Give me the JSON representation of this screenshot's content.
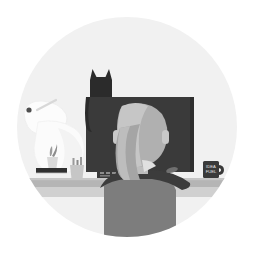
{
  "illustration": {
    "title": "Person working at desk with cat on monitor",
    "alt_text": "Flat grayscale illustration, circular badge: a person seen from behind sits at a desk in front of a large monitor, a cat sits on top of the monitor, a desk lamp, plant, books, pen cup, keyboard, mouse and coffee mug are on the desk",
    "canvas": {
      "width": 254,
      "height": 259
    },
    "background_color": "#ffffff",
    "circle": {
      "name": "backdrop-circle",
      "center_x": 127,
      "center_y": 127,
      "radius": 110,
      "fill": "#f1f1f1"
    },
    "palette": {
      "white": "#ffffff",
      "circle_bg": "#f1f1f1",
      "off_white": "#fafafa",
      "very_light_gray": "#e6e6e6",
      "light_gray": "#d2d2d2",
      "mid_gray": "#a8a8a8",
      "warm_gray": "#8e8e8e",
      "body_gray": "#7d7d7d",
      "dark_gray": "#4a4a4a",
      "near_black": "#3a3a3a",
      "black": "#2b2b2b"
    },
    "objects": [
      {
        "id": "desk",
        "label": "Desk",
        "color": "#b4b4b4",
        "shadow_color": "#cfcfcf",
        "top_y": 178,
        "height": 9
      },
      {
        "id": "monitor",
        "label": "Monitor",
        "screen_color": "#3a3a3a",
        "bezel_color": "#2f2f2f",
        "x": 86,
        "y": 97,
        "width": 108,
        "height": 75
      },
      {
        "id": "cat",
        "label": "Cat silhouette on monitor",
        "color": "#2b2b2b",
        "description": "black cat with pointed ears and hanging tail, sitting on top-left of the monitor"
      },
      {
        "id": "person",
        "label": "Person seen from behind",
        "hair_color": "#adadad",
        "hair_highlight": "#c6c6c6",
        "skin_color": "#c9c9c9",
        "shirt_color": "#7d7d7d",
        "collar_color": "#3c3c3c",
        "description": "seated figure with a long ponytail/bun, dark collar, light gray torso"
      },
      {
        "id": "lamp",
        "label": "Desk lamp",
        "color": "#fbfbfb",
        "outline": "#e3e3e3",
        "accent": "#555555",
        "description": "pale white articulated desk lamp at the left with a small dark hinge dot"
      },
      {
        "id": "plant",
        "label": "Small potted plant",
        "pot_color": "#d7d7d7",
        "leaf_color": "#9c9c9c"
      },
      {
        "id": "books",
        "label": "Stack of books",
        "top_color": "#2f2f2f",
        "bottom_color": "#efefef",
        "edge_color": "#bdbdbd"
      },
      {
        "id": "pen-cup",
        "label": "Pen cup with pens",
        "cup_color": "#c4c4c4",
        "pen_color": "#9a9a9a"
      },
      {
        "id": "keyboard",
        "label": "Keyboard",
        "color": "#3a3a3a",
        "key_color": "#8c8c8c"
      },
      {
        "id": "mouse",
        "label": "Mouse",
        "color": "#6f6f6f"
      },
      {
        "id": "mug",
        "label": "Coffee mug",
        "body_color": "#3a3a3a",
        "text_color": "#e8e8e8",
        "text_line_1": "IDEA",
        "text_line_2": "FUEL"
      }
    ]
  }
}
